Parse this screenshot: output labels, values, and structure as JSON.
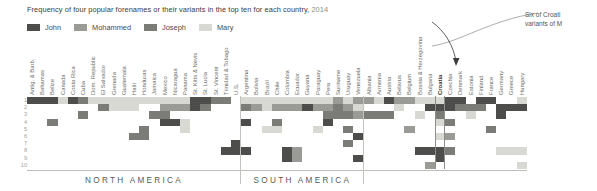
{
  "title": {
    "text": "Frequency of four popular forenames or their variants in the top ten for each country,",
    "year": "2014"
  },
  "legend": {
    "items": [
      {
        "label": "John",
        "color": "#4d4d4b"
      },
      {
        "label": "Mohammed",
        "color": "#9a9a96"
      },
      {
        "label": "Joseph",
        "color": "#7b7b78"
      },
      {
        "label": "Mary",
        "color": "#d9d9d4"
      }
    ]
  },
  "annotation": {
    "line1": "Six of Croati",
    "line2": "variants of M"
  },
  "rank_axis": {
    "labels": [
      "1",
      "2",
      "3",
      "4",
      "5",
      "6",
      "7",
      "8",
      "9",
      "10"
    ]
  },
  "groups": [
    {
      "name": "NORTH AMERICA"
    },
    {
      "name": "SOUTH AMERICA"
    }
  ],
  "chart_data": {
    "type": "heatmap",
    "title": "Frequency of four popular forenames or their variants in the top ten for each country, 2014",
    "xlabel": "",
    "ylabel": "Rank",
    "ylim": [
      1,
      10
    ],
    "grid": false,
    "legend_position": "top-left",
    "value_colors": {
      "John": "#4d4d4b",
      "Mohammed": "#9a9a96",
      "Joseph": "#7b7b78",
      "Mary": "#d9d9d4",
      "empty": "#ffffff"
    },
    "y_categories": [
      "1",
      "2",
      "3",
      "4",
      "5",
      "6",
      "7",
      "8",
      "9",
      "10"
    ],
    "highlight_column": "Croatia",
    "columns": [
      {
        "country": "Antig. & Barb.",
        "group": "NORTH AMERICA",
        "cells": [
          {
            "rank": 1,
            "name": "John"
          }
        ]
      },
      {
        "country": "Bahamas",
        "group": "NORTH AMERICA",
        "cells": [
          {
            "rank": 1,
            "name": "John"
          }
        ]
      },
      {
        "country": "Belize",
        "group": "NORTH AMERICA",
        "cells": [
          {
            "rank": 1,
            "name": "John"
          },
          {
            "rank": 4,
            "name": "Joseph"
          }
        ]
      },
      {
        "country": "Canada",
        "group": "NORTH AMERICA",
        "cells": [
          {
            "rank": 1,
            "name": "Mary"
          }
        ]
      },
      {
        "country": "Costa Rica",
        "group": "NORTH AMERICA",
        "cells": [
          {
            "rank": 1,
            "name": "John"
          }
        ]
      },
      {
        "country": "Cuba",
        "group": "NORTH AMERICA",
        "cells": [
          {
            "rank": 1,
            "name": "Joseph"
          },
          {
            "rank": 3,
            "name": "Joseph"
          }
        ]
      },
      {
        "country": "Dom. Republic",
        "group": "NORTH AMERICA",
        "cells": [
          {
            "rank": 1,
            "name": "Mary"
          }
        ]
      },
      {
        "country": "El Salvador",
        "group": "NORTH AMERICA",
        "cells": [
          {
            "rank": 1,
            "name": "Mary"
          },
          {
            "rank": 2,
            "name": "Joseph"
          }
        ]
      },
      {
        "country": "Grenada",
        "group": "NORTH AMERICA",
        "cells": [
          {
            "rank": 1,
            "name": "Mary"
          },
          {
            "rank": 2,
            "name": "Mary"
          }
        ]
      },
      {
        "country": "Guatemala",
        "group": "NORTH AMERICA",
        "cells": [
          {
            "rank": 1,
            "name": "Mary"
          },
          {
            "rank": 2,
            "name": "Mary"
          }
        ]
      },
      {
        "country": "Haiti",
        "group": "NORTH AMERICA",
        "cells": [
          {
            "rank": 1,
            "name": "Mary"
          },
          {
            "rank": 2,
            "name": "Mary"
          },
          {
            "rank": 6,
            "name": "Joseph"
          }
        ]
      },
      {
        "country": "Honduras",
        "group": "NORTH AMERICA",
        "cells": [
          {
            "rank": 1,
            "name": "Mary"
          },
          {
            "rank": 5,
            "name": "Joseph"
          },
          {
            "rank": 6,
            "name": "Joseph"
          }
        ]
      },
      {
        "country": "Jamaica",
        "group": "NORTH AMERICA",
        "cells": [
          {
            "rank": 1,
            "name": "Mary"
          },
          {
            "rank": 3,
            "name": "Joseph"
          }
        ]
      },
      {
        "country": "Mexico",
        "group": "NORTH AMERICA",
        "cells": [
          {
            "rank": 1,
            "name": "Mary"
          },
          {
            "rank": 2,
            "name": "Mohammed"
          },
          {
            "rank": 3,
            "name": "Joseph"
          },
          {
            "rank": 4,
            "name": "John"
          }
        ]
      },
      {
        "country": "Nicaragua",
        "group": "NORTH AMERICA",
        "cells": [
          {
            "rank": 1,
            "name": "Mary"
          },
          {
            "rank": 2,
            "name": "Mohammed"
          },
          {
            "rank": 4,
            "name": "John"
          }
        ]
      },
      {
        "country": "Panama",
        "group": "NORTH AMERICA",
        "cells": [
          {
            "rank": 1,
            "name": "Mary"
          },
          {
            "rank": 2,
            "name": "Mohammed"
          },
          {
            "rank": 4,
            "name": "Mary"
          },
          {
            "rank": 5,
            "name": "Mary"
          }
        ]
      },
      {
        "country": "St. Kitts & Nevis",
        "group": "NORTH AMERICA",
        "cells": [
          {
            "rank": 1,
            "name": "John"
          },
          {
            "rank": 2,
            "name": "John"
          }
        ]
      },
      {
        "country": "St. Lucia",
        "group": "NORTH AMERICA",
        "cells": [
          {
            "rank": 1,
            "name": "John"
          },
          {
            "rank": 2,
            "name": "Joseph"
          }
        ]
      },
      {
        "country": "St. Vincent",
        "group": "NORTH AMERICA",
        "cells": [
          {
            "rank": 1,
            "name": "Joseph"
          }
        ]
      },
      {
        "country": "Trinidad & Tobago",
        "group": "NORTH AMERICA",
        "cells": [
          {
            "rank": 1,
            "name": "Joseph"
          },
          {
            "rank": 8,
            "name": "John"
          }
        ]
      },
      {
        "country": "U.S.",
        "group": "NORTH AMERICA",
        "cells": [
          {
            "rank": 7,
            "name": "John"
          },
          {
            "rank": 8,
            "name": "John"
          }
        ]
      },
      {
        "country": "Argentina",
        "group": "SOUTH AMERICA",
        "cells": [
          {
            "rank": 1,
            "name": "Mary"
          },
          {
            "rank": 2,
            "name": "Joseph"
          },
          {
            "rank": 4,
            "name": "John"
          },
          {
            "rank": 8,
            "name": "John"
          }
        ]
      },
      {
        "country": "Bolivia",
        "group": "SOUTH AMERICA",
        "cells": [
          {
            "rank": 1,
            "name": "Mary"
          },
          {
            "rank": 2,
            "name": "Mohammed"
          }
        ]
      },
      {
        "country": "Brazil",
        "group": "SOUTH AMERICA",
        "cells": [
          {
            "rank": 1,
            "name": "Mary"
          },
          {
            "rank": 2,
            "name": "Mary"
          },
          {
            "rank": 5,
            "name": "Mary"
          }
        ]
      },
      {
        "country": "Chile",
        "group": "SOUTH AMERICA",
        "cells": [
          {
            "rank": 1,
            "name": "Mary"
          },
          {
            "rank": 2,
            "name": "Mohammed"
          },
          {
            "rank": 4,
            "name": "Joseph"
          },
          {
            "rank": 5,
            "name": "Mary"
          }
        ]
      },
      {
        "country": "Colombia",
        "group": "SOUTH AMERICA",
        "cells": [
          {
            "rank": 1,
            "name": "Mary"
          },
          {
            "rank": 2,
            "name": "Mohammed"
          },
          {
            "rank": 8,
            "name": "John"
          },
          {
            "rank": 9,
            "name": "John"
          }
        ]
      },
      {
        "country": "Ecuador",
        "group": "SOUTH AMERICA",
        "cells": [
          {
            "rank": 1,
            "name": "Mary"
          },
          {
            "rank": 2,
            "name": "Mohammed"
          },
          {
            "rank": 8,
            "name": "Mohammed"
          },
          {
            "rank": 9,
            "name": "Mohammed"
          }
        ]
      },
      {
        "country": "Guyana",
        "group": "SOUTH AMERICA",
        "cells": [
          {
            "rank": 1,
            "name": "Mary"
          },
          {
            "rank": 2,
            "name": "John"
          }
        ]
      },
      {
        "country": "Paraguay",
        "group": "SOUTH AMERICA",
        "cells": [
          {
            "rank": 1,
            "name": "Mary"
          },
          {
            "rank": 2,
            "name": "Mohammed"
          },
          {
            "rank": 5,
            "name": "Mary"
          }
        ]
      },
      {
        "country": "Peru",
        "group": "SOUTH AMERICA",
        "cells": [
          {
            "rank": 1,
            "name": "Mary"
          },
          {
            "rank": 2,
            "name": "Mohammed"
          },
          {
            "rank": 3,
            "name": "Joseph"
          },
          {
            "rank": 4,
            "name": "John"
          }
        ]
      },
      {
        "country": "Suriname",
        "group": "SOUTH AMERICA",
        "cells": [
          {
            "rank": 1,
            "name": "Mohammed"
          },
          {
            "rank": 2,
            "name": "Joseph"
          },
          {
            "rank": 3,
            "name": "Joseph"
          }
        ]
      },
      {
        "country": "Uruguay",
        "group": "SOUTH AMERICA",
        "cells": [
          {
            "rank": 1,
            "name": "Mary"
          },
          {
            "rank": 2,
            "name": "Mohammed"
          },
          {
            "rank": 3,
            "name": "Joseph"
          },
          {
            "rank": 5,
            "name": "Joseph"
          },
          {
            "rank": 7,
            "name": "Joseph"
          }
        ]
      },
      {
        "country": "Venezuela",
        "group": "SOUTH AMERICA",
        "cells": [
          {
            "rank": 1,
            "name": "Mohammed"
          },
          {
            "rank": 2,
            "name": "Mary"
          },
          {
            "rank": 3,
            "name": "Mohammed"
          },
          {
            "rank": 6,
            "name": "John"
          },
          {
            "rank": 9,
            "name": "John"
          }
        ]
      },
      {
        "country": "Albania",
        "group": "EUROPE",
        "cells": [
          {
            "rank": 1,
            "name": "Mohammed"
          },
          {
            "rank": 3,
            "name": "Joseph"
          }
        ]
      },
      {
        "country": "Armenia",
        "group": "EUROPE",
        "cells": [
          {
            "rank": 1,
            "name": "Mary"
          },
          {
            "rank": 3,
            "name": "Joseph"
          }
        ]
      },
      {
        "country": "Austria",
        "group": "EUROPE",
        "cells": [
          {
            "rank": 1,
            "name": "John"
          },
          {
            "rank": 3,
            "name": "Joseph"
          }
        ]
      },
      {
        "country": "Belarus",
        "group": "EUROPE",
        "cells": [
          {
            "rank": 1,
            "name": "Mohammed"
          },
          {
            "rank": 2,
            "name": "Mary"
          }
        ]
      },
      {
        "country": "Belgium",
        "group": "EUROPE",
        "cells": [
          {
            "rank": 1,
            "name": "Mohammed"
          },
          {
            "rank": 5,
            "name": "Mohammed"
          }
        ]
      },
      {
        "country": "Bosnia & Herzegovina",
        "group": "EUROPE",
        "cells": [
          {
            "rank": 1,
            "name": "Mary"
          },
          {
            "rank": 3,
            "name": "Mary"
          },
          {
            "rank": 8,
            "name": "John"
          }
        ]
      },
      {
        "country": "Bulgaria",
        "group": "EUROPE",
        "cells": [
          {
            "rank": 1,
            "name": "Mary"
          },
          {
            "rank": 2,
            "name": "John"
          },
          {
            "rank": 8,
            "name": "John"
          },
          {
            "rank": 10,
            "name": "Mohammed"
          }
        ]
      },
      {
        "country": "Croatia",
        "group": "EUROPE",
        "cells": [
          {
            "rank": 1,
            "name": "Mary"
          },
          {
            "rank": 2,
            "name": "John"
          },
          {
            "rank": 3,
            "name": "Joseph"
          },
          {
            "rank": 4,
            "name": "Mary"
          },
          {
            "rank": 6,
            "name": "Mary"
          },
          {
            "rank": 8,
            "name": "John"
          },
          {
            "rank": 9,
            "name": "John"
          }
        ]
      },
      {
        "country": "Czechia",
        "group": "EUROPE",
        "cells": [
          {
            "rank": 1,
            "name": "John"
          },
          {
            "rank": 2,
            "name": "John"
          },
          {
            "rank": 4,
            "name": "Joseph"
          },
          {
            "rank": 6,
            "name": "Mohammed"
          },
          {
            "rank": 8,
            "name": "Joseph"
          }
        ]
      },
      {
        "country": "Denmark",
        "group": "EUROPE",
        "cells": [
          {
            "rank": 1,
            "name": "John"
          },
          {
            "rank": 2,
            "name": "Joseph"
          }
        ]
      },
      {
        "country": "Estonia",
        "group": "EUROPE",
        "cells": [
          {
            "rank": 2,
            "name": "Joseph"
          },
          {
            "rank": 3,
            "name": "Mary"
          }
        ]
      },
      {
        "country": "Finland",
        "group": "EUROPE",
        "cells": [
          {
            "rank": 1,
            "name": "John"
          },
          {
            "rank": 2,
            "name": "Joseph"
          }
        ]
      },
      {
        "country": "France",
        "group": "EUROPE",
        "cells": [
          {
            "rank": 1,
            "name": "John"
          },
          {
            "rank": 5,
            "name": "Joseph"
          }
        ]
      },
      {
        "country": "Germany",
        "group": "EUROPE",
        "cells": [
          {
            "rank": 2,
            "name": "John"
          },
          {
            "rank": 3,
            "name": "John"
          },
          {
            "rank": 8,
            "name": "Mary"
          }
        ]
      },
      {
        "country": "Greece",
        "group": "EUROPE",
        "cells": [
          {
            "rank": 2,
            "name": "John"
          },
          {
            "rank": 8,
            "name": "Mary"
          }
        ]
      },
      {
        "country": "Hungary",
        "group": "EUROPE",
        "cells": [
          {
            "rank": 1,
            "name": "Mary"
          },
          {
            "rank": 2,
            "name": "John"
          },
          {
            "rank": 8,
            "name": "Mary"
          },
          {
            "rank": 10,
            "name": "Mary"
          }
        ]
      }
    ]
  }
}
